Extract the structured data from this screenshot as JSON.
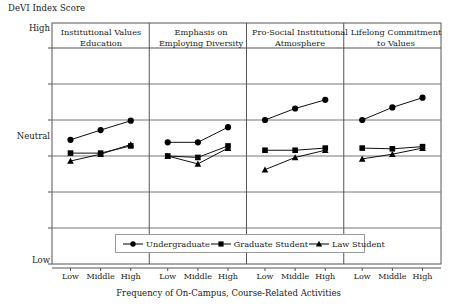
{
  "axes": {
    "y_title": "DeVI Index Score",
    "y_tick_high": "High",
    "y_tick_neutral": "Neutral",
    "y_tick_low": "Low",
    "x_title": "Frequency of On-Campus, Course-Related Activities",
    "x_categories": [
      "Low",
      "Middle",
      "High"
    ]
  },
  "legend": {
    "items": [
      {
        "label": "Undergraduate",
        "marker": "circle-marker",
        "color": "#000000"
      },
      {
        "label": "Graduate Student",
        "marker": "square-marker",
        "color": "#000000"
      },
      {
        "label": "Law Student",
        "marker": "triangle-marker",
        "color": "#000000"
      }
    ]
  },
  "panels": [
    {
      "title_line1": "Institutional Values",
      "title_line2": "Education"
    },
    {
      "title_line1": "Emphasis on",
      "title_line2": "Employing Diversity"
    },
    {
      "title_line1": "Pro-Social Institutional",
      "title_line2": "Atmosphere"
    },
    {
      "title_line1": "Lifelong Commitment",
      "title_line2": "to Values"
    }
  ],
  "chart_data": {
    "type": "line",
    "title": "",
    "xlabel": "Frequency of On-Campus, Course-Related Activities",
    "ylabel": "DeVI Index Score",
    "ylim": [
      0,
      6
    ],
    "ytick_positions": [
      0,
      1,
      2,
      3,
      4,
      5,
      6
    ],
    "ytick_labels": [
      "Low",
      "",
      "",
      "Neutral",
      "",
      "",
      "High"
    ],
    "grid": true,
    "legend_position": "bottom-center",
    "categories": [
      "Low",
      "Middle",
      "High"
    ],
    "panels": [
      {
        "name": "Institutional Values Education",
        "series": [
          {
            "name": "Undergraduate",
            "values": [
              3.45,
              3.72,
              3.98
            ]
          },
          {
            "name": "Graduate Student",
            "values": [
              3.08,
              3.08,
              3.28
            ]
          },
          {
            "name": "Law Student",
            "values": [
              2.86,
              3.05,
              3.32
            ]
          }
        ]
      },
      {
        "name": "Emphasis on Employing Diversity",
        "series": [
          {
            "name": "Undergraduate",
            "values": [
              3.38,
              3.38,
              3.8
            ]
          },
          {
            "name": "Graduate Student",
            "values": [
              3.0,
              2.96,
              3.28
            ]
          },
          {
            "name": "Law Student",
            "values": [
              3.0,
              2.78,
              3.22
            ]
          }
        ]
      },
      {
        "name": "Pro-Social Institutional Atmosphere",
        "series": [
          {
            "name": "Undergraduate",
            "values": [
              4.0,
              4.32,
              4.56
            ]
          },
          {
            "name": "Graduate Student",
            "values": [
              3.16,
              3.16,
              3.22
            ]
          },
          {
            "name": "Law Student",
            "values": [
              2.62,
              2.96,
              3.16
            ]
          }
        ]
      },
      {
        "name": "Lifelong Commitment to Values",
        "series": [
          {
            "name": "Undergraduate",
            "values": [
              4.0,
              4.35,
              4.62
            ]
          },
          {
            "name": "Graduate Student",
            "values": [
              3.22,
              3.2,
              3.26
            ]
          },
          {
            "name": "Law Student",
            "values": [
              2.92,
              3.05,
              3.22
            ]
          }
        ]
      }
    ]
  }
}
